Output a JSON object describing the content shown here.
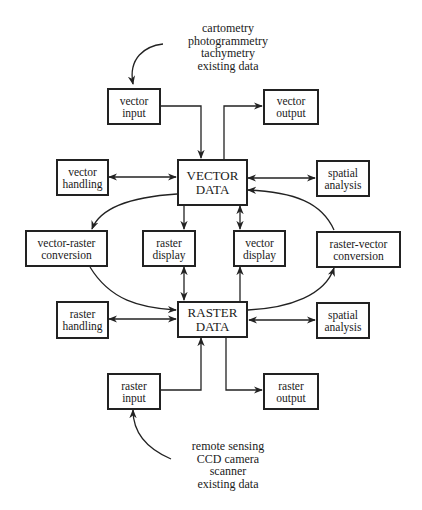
{
  "diagram": {
    "type": "data-flow",
    "colors": {
      "line": "#222222",
      "background": "#ffffff"
    },
    "top_sources": [
      "cartometry",
      "photogrammetry",
      "tachymetry",
      "existing data"
    ],
    "bottom_sources": [
      "remote sensing",
      "CCD camera",
      "scanner",
      "existing data"
    ],
    "boxes": {
      "vector_input": {
        "line1": "vector",
        "line2": "input"
      },
      "vector_output": {
        "line1": "vector",
        "line2": "output"
      },
      "vector_handling": {
        "line1": "vector",
        "line2": "handling"
      },
      "vector_data": {
        "line1": "VECTOR",
        "line2": "DATA"
      },
      "spatial_analysis_top": {
        "line1": "spatial",
        "line2": "analysis"
      },
      "vector_raster_conversion": {
        "line1": "vector-raster",
        "line2": "conversion"
      },
      "raster_display": {
        "line1": "raster",
        "line2": "display"
      },
      "vector_display": {
        "line1": "vector",
        "line2": "display"
      },
      "raster_vector_conversion": {
        "line1": "raster-vector",
        "line2": "conversion"
      },
      "raster_handling": {
        "line1": "raster",
        "line2": "handling"
      },
      "raster_data": {
        "line1": "RASTER",
        "line2": "DATA"
      },
      "spatial_analysis_bottom": {
        "line1": "spatial",
        "line2": "analysis"
      },
      "raster_input": {
        "line1": "raster",
        "line2": "input"
      },
      "raster_output": {
        "line1": "raster",
        "line2": "output"
      }
    },
    "edges": [
      {
        "from": "top_sources",
        "to": "vector_input"
      },
      {
        "from": "vector_input",
        "to": "vector_data"
      },
      {
        "from": "vector_data",
        "to": "vector_output"
      },
      {
        "from": "vector_handling",
        "to": "vector_data",
        "bidirectional": true
      },
      {
        "from": "vector_data",
        "to": "spatial_analysis_top",
        "bidirectional": true
      },
      {
        "from": "vector_data",
        "to": "vector_raster_conversion"
      },
      {
        "from": "vector_data",
        "to": "raster_display"
      },
      {
        "from": "vector_data",
        "to": "vector_display",
        "bidirectional": true
      },
      {
        "from": "raster_vector_conversion",
        "to": "vector_data"
      },
      {
        "from": "vector_raster_conversion",
        "to": "raster_data"
      },
      {
        "from": "raster_display",
        "to": "raster_data",
        "bidirectional": true
      },
      {
        "from": "raster_data",
        "to": "vector_display"
      },
      {
        "from": "raster_data",
        "to": "raster_vector_conversion"
      },
      {
        "from": "raster_handling",
        "to": "raster_data",
        "bidirectional": true
      },
      {
        "from": "raster_data",
        "to": "spatial_analysis_bottom",
        "bidirectional": true
      },
      {
        "from": "raster_input",
        "to": "raster_data"
      },
      {
        "from": "raster_data",
        "to": "raster_output"
      },
      {
        "from": "bottom_sources",
        "to": "raster_input"
      }
    ]
  }
}
